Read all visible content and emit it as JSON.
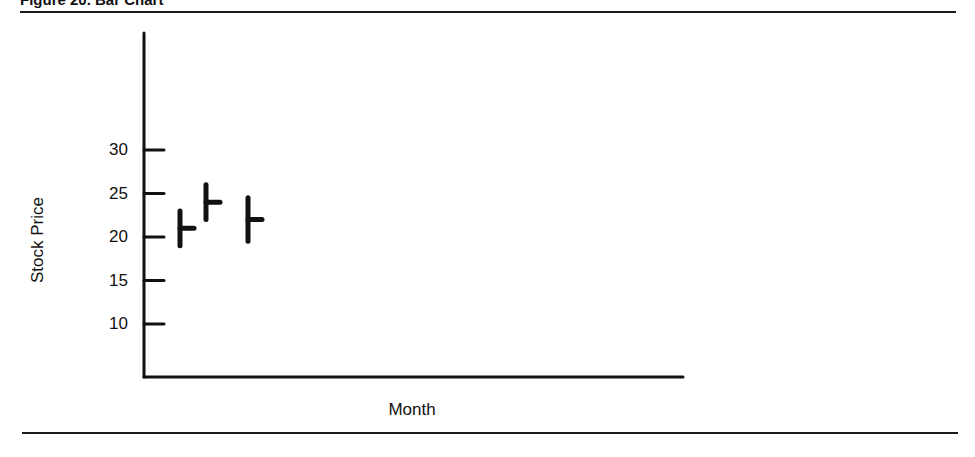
{
  "figure": {
    "title": "Figure 20. Bar Chart"
  },
  "chart_data": {
    "type": "ohlc-bar",
    "title": "Figure 20. Bar Chart",
    "xlabel": "Month",
    "ylabel": "Stock Price",
    "yticks": [
      10,
      15,
      20,
      25,
      30
    ],
    "ylim": [
      5,
      43
    ],
    "grid": false,
    "legend": null,
    "categories": [
      "Month 1",
      "Month 2",
      "Month 3"
    ],
    "series": [
      {
        "name": "High",
        "values": [
          23,
          26,
          24.5
        ]
      },
      {
        "name": "Low",
        "values": [
          19,
          22,
          19.5
        ]
      },
      {
        "name": "Close",
        "values": [
          21,
          24,
          22
        ]
      }
    ],
    "bars": [
      {
        "high": 23,
        "low": 19,
        "close": 21
      },
      {
        "high": 26,
        "low": 22,
        "close": 24
      },
      {
        "high": 24.5,
        "low": 19.5,
        "close": 22
      }
    ]
  }
}
